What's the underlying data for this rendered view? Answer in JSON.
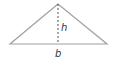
{
  "diagram": {
    "type": "triangle",
    "labels": {
      "height": "h",
      "base": "b"
    },
    "colors": {
      "stroke": "#9a9a9a",
      "altitude": "#555555",
      "text": "#333333"
    }
  }
}
